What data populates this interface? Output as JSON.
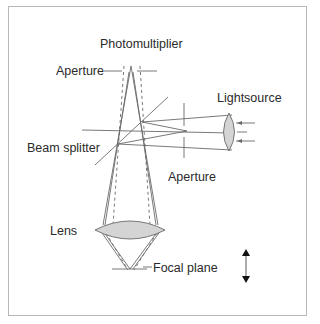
{
  "diagram": {
    "labels": {
      "photomultiplier": "Photomultiplier",
      "aperture_top": "Aperture",
      "lightsource": "Lightsource",
      "beam_splitter": "Beam splitter",
      "aperture_right": "Aperture",
      "lens": "Lens",
      "focal_plane": "Focal plane"
    },
    "colors": {
      "line": "#6a6a6a",
      "lens_fill": "#d4d4d4",
      "text": "#2a2a2a",
      "frame": "#b8b8b8"
    },
    "icons": {
      "movement_arrow": "double-vertical-arrow"
    }
  }
}
